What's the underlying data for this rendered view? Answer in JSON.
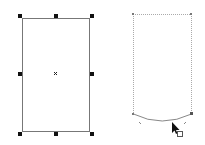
{
  "colors": {
    "background": "#ffffff",
    "outline": "#777777",
    "handle": "#111111",
    "dotted_outline": "#9a9a9a",
    "cursor": "#111111"
  },
  "left_shape": {
    "label": "selected-rectangle",
    "x": 22,
    "y": 18,
    "width": 67,
    "height": 113,
    "handles": 8,
    "center_marker": "x"
  },
  "right_shape": {
    "label": "rectangle-with-curved-bottom",
    "x": 133,
    "y": 14,
    "width": 59,
    "height": 100,
    "curve_sag": 8
  },
  "cursor": {
    "icon": "arrow-cursor-with-square-icon",
    "x": 172,
    "y": 123
  }
}
